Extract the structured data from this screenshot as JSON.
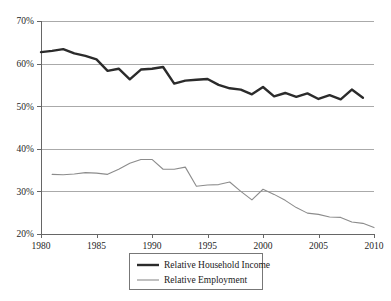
{
  "chart_data": {
    "type": "line",
    "title": "",
    "subtitle": "",
    "xlabel": "",
    "ylabel": "",
    "xlim": [
      1980,
      2010
    ],
    "ylim": [
      20,
      70
    ],
    "xticks": [
      1980,
      1985,
      1990,
      1995,
      2000,
      2005,
      2010
    ],
    "xtick_labels": [
      "1980",
      "1985",
      "1990",
      "1995",
      "2000",
      "2005",
      "2010"
    ],
    "yticks": [
      20,
      30,
      40,
      50,
      60,
      70
    ],
    "ytick_labels": [
      "20%",
      "30%",
      "40%",
      "50%",
      "60%",
      "70%"
    ],
    "grid": "horizontal",
    "legend_position": "bottom-center",
    "series": [
      {
        "name": "Relative Household Income",
        "color": "#2b2b2b",
        "line_width": 2.4,
        "x": [
          1980,
          1981,
          1982,
          1983,
          1984,
          1985,
          1986,
          1987,
          1988,
          1989,
          1990,
          1991,
          1992,
          1993,
          1994,
          1995,
          1996,
          1997,
          1998,
          1999,
          2000,
          2001,
          2002,
          2003,
          2004,
          2005,
          2006,
          2007,
          2008,
          2009
        ],
        "values": [
          62.7,
          63.0,
          63.4,
          62.4,
          61.8,
          61.0,
          58.3,
          58.8,
          56.3,
          58.6,
          58.8,
          59.2,
          55.3,
          56.0,
          56.2,
          56.4,
          55.0,
          54.2,
          53.9,
          52.8,
          54.5,
          52.3,
          53.1,
          52.2,
          53.0,
          51.7,
          52.6,
          51.6,
          53.9,
          52.0
        ]
      },
      {
        "name": "Relative Employment",
        "color": "#8c8c8c",
        "line_width": 1.1,
        "x": [
          1981,
          1982,
          1983,
          1984,
          1985,
          1986,
          1987,
          1988,
          1989,
          1990,
          1991,
          1992,
          1993,
          1994,
          1995,
          1996,
          1997,
          1998,
          1999,
          2000,
          2001,
          2002,
          2003,
          2004,
          2005,
          2006,
          2007,
          2008,
          2009,
          2010
        ],
        "values": [
          34.0,
          33.9,
          34.1,
          34.4,
          34.3,
          34.0,
          35.2,
          36.6,
          37.5,
          37.5,
          35.2,
          35.2,
          35.7,
          31.2,
          31.5,
          31.6,
          32.2,
          30.0,
          28.0,
          30.5,
          29.3,
          27.9,
          26.2,
          24.9,
          24.6,
          24.0,
          23.9,
          22.8,
          22.5,
          21.5
        ]
      }
    ],
    "legend": [
      {
        "label": "Relative Household Income",
        "color": "#2b2b2b",
        "line_width": 2.4
      },
      {
        "label": "Relative Employment",
        "color": "#8c8c8c",
        "line_width": 1.1
      }
    ]
  },
  "plot_geometry": {
    "left": 41,
    "right": 374,
    "top": 21,
    "bottom": 234
  },
  "legend_geometry": {
    "x": 129,
    "y": 253,
    "width": 133,
    "height": 36
  }
}
